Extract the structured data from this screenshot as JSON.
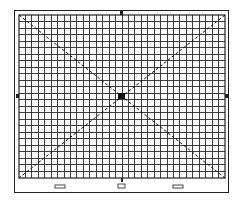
{
  "diagram": {
    "type": "test-pattern-grid",
    "grid": {
      "columns": 32,
      "rows": 25,
      "line_color": "#2a2a2a",
      "background": "#ffffff"
    },
    "diagonals": [
      "top-left-to-bottom-right",
      "top-right-to-bottom-left"
    ],
    "center_marker": "filled-square",
    "edge_markers": [
      "top-center",
      "left-middle",
      "right-middle",
      "bottom-center"
    ],
    "bottom_indicators": [
      "left-slot",
      "center-symbol",
      "right-slot"
    ],
    "colors": {
      "ink": "#222222",
      "paper": "#ffffff"
    }
  }
}
